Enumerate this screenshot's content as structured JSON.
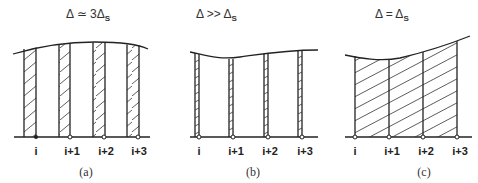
{
  "panels": [
    {
      "id": "a",
      "title_main": "Δ ≃ 3Δ",
      "title_sub": "S",
      "caption": "(a)",
      "stations": [
        "i",
        "i+1",
        "i+2",
        "i+3"
      ],
      "strip_description": "hatched strips of width ~Δs at each station, spacing Δ ≃ 3Δs"
    },
    {
      "id": "b",
      "title_main": "Δ >> Δ",
      "title_sub": "S",
      "caption": "(b)",
      "stations": [
        "i",
        "i+1",
        "i+2",
        "i+3"
      ],
      "strip_description": "very narrow hatched strips, spacing Δ much larger than Δs"
    },
    {
      "id": "c",
      "title_main": "Δ = Δ",
      "title_sub": "S",
      "caption": "(c)",
      "stations": [
        "i",
        "i+1",
        "i+2",
        "i+3"
      ],
      "strip_description": "fully hatched area between stations, spacing equal to Δs"
    }
  ]
}
